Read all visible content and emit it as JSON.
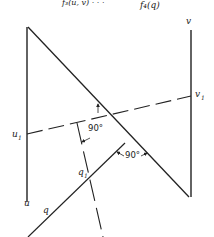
{
  "header": {
    "caption_left": "f₃(u, v) · · ·",
    "caption_right": "f₄(q)"
  },
  "labels": {
    "v": "v",
    "v1": "v",
    "v1_sub": "1",
    "u1": "u",
    "u1_sub": "1",
    "u": "u",
    "q": "q",
    "q1": "q",
    "q1_sub": "1",
    "angle_upper": "90°",
    "angle_lower": "90°"
  },
  "colors": {
    "line": "#222222",
    "background": "#ffffff"
  }
}
